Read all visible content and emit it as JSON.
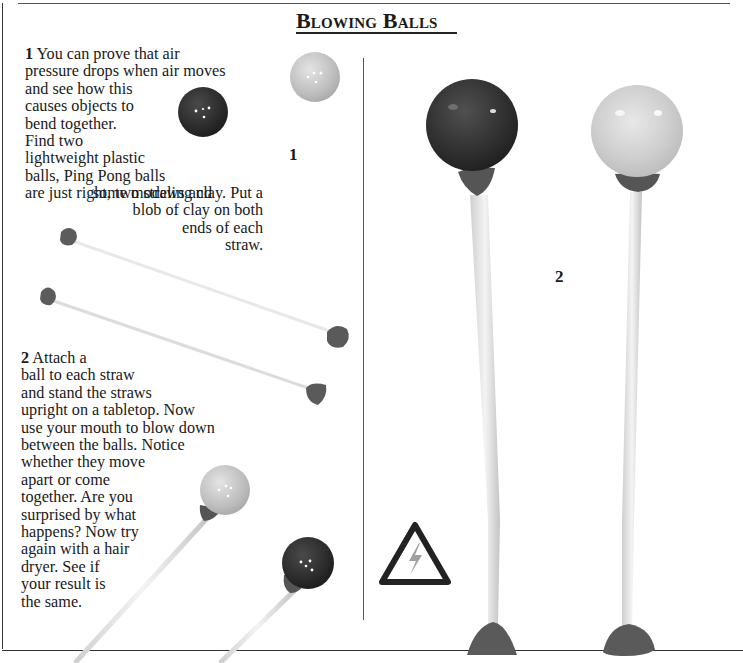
{
  "page": {
    "title": "Blowing Balls"
  },
  "steps": [
    {
      "number": "1",
      "text_lines_left": [
        "You can prove that air",
        "pressure drops when air moves",
        "and see how this",
        "causes objects to",
        "bend together.",
        "Find two",
        "lightweight plastic",
        "balls, Ping Pong balls",
        "are just right, two straws and"
      ],
      "text_lines_right": [
        "some modeling clay. Put a",
        "blob of clay on both",
        "ends of each",
        "straw."
      ]
    },
    {
      "number": "2",
      "text_lines": [
        "Attach a",
        "ball to each straw",
        "and stand the straws",
        "upright on a tabletop. Now",
        "use your mouth to blow down",
        "between the balls. Notice",
        "whether they move",
        "apart or come",
        "together. Are you",
        "surprised by what",
        "happens? Now try",
        "again with a hair",
        "dryer. See if",
        "your result is",
        "the same."
      ]
    }
  ],
  "figures": {
    "fig1_label": "1",
    "fig2_label": "2"
  },
  "icons": {
    "warning": "electrical-hazard-warning-icon"
  },
  "colors": {
    "dark_ball": "#2a2a2a",
    "light_ball": "#c9c9c9",
    "clay": "#5a5a5a",
    "straw": "#e6e6e6",
    "rule": "#333333"
  }
}
